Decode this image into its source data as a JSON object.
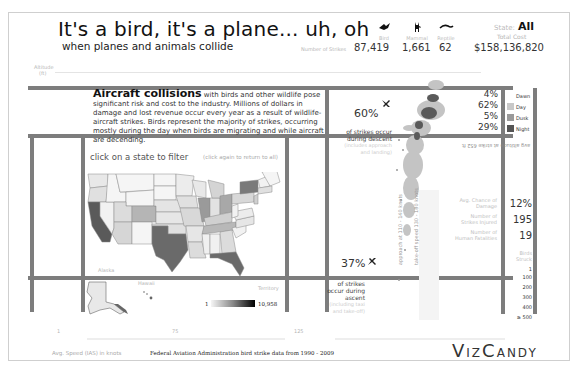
{
  "header": {
    "title": "It's a bird, it's a plane... uh, oh",
    "subtitle": "when planes and animals collide",
    "strikes_label": "Number of Strikes",
    "categories": [
      {
        "icon": "bird-icon",
        "glyph": "🕊",
        "label": "Bird",
        "count": "87,419"
      },
      {
        "icon": "deer-icon",
        "glyph": "🦌",
        "label": "Mammal",
        "count": "1,661"
      },
      {
        "icon": "reptile-icon",
        "glyph": "〰",
        "label": "Reptile",
        "count": "62"
      }
    ],
    "state_label": "State:",
    "state_value": "All",
    "total_cost_label": "Total Cost",
    "total_cost_value": "$158,136,820"
  },
  "axes": {
    "altitude_label": "Altitude",
    "altitude_unit": "(ft)",
    "speed_label": "Avg. Speed (IAS) in knots",
    "speed_ticks": [
      "1",
      "75",
      "125"
    ]
  },
  "intro": {
    "lead": "Aircraft collisions",
    "body": "with birds and other wildlife pose significant risk and cost to the industry.  Millions of dollars in damage and lost revenue occur every year as a result of wildlife-aircraft strikes.  Birds represent the majority of strikes, occurring mostly during the day when birds are migrating and while aircraft are decending."
  },
  "descent": {
    "percent": "60%",
    "line1": "of strikes occur",
    "line2": "during descent",
    "detail": "(includes approach and landing)"
  },
  "ascent": {
    "percent": "37%",
    "line1": "of strikes",
    "line2": "occur during",
    "line3": "ascent",
    "detail": "(including taxi and take-off)"
  },
  "time_of_day": {
    "items": [
      {
        "label": "Dawn",
        "percent": "4%",
        "color": "#ffffff"
      },
      {
        "label": "Day",
        "percent": "62%",
        "color": "#c8c8c8"
      },
      {
        "label": "Dusk",
        "percent": "5%",
        "color": "#9a9a9a"
      },
      {
        "label": "Night",
        "percent": "29%",
        "color": "#555555"
      }
    ]
  },
  "avg_altitude_label": "avg altitude at strike 652 ft",
  "stats": [
    {
      "label": "Avg. Chance of Damage",
      "value": "12%"
    },
    {
      "label": "Number of Strikes Injured",
      "value": "195"
    },
    {
      "label": "Number of Human Fatalities",
      "value": "19"
    }
  ],
  "strike_size": {
    "label": "Birds Struck",
    "ticks": [
      "1",
      "100",
      "200",
      "300",
      "400",
      "≥ 500"
    ]
  },
  "scatter_labels": {
    "approach": "approach at 110 - 140 knots",
    "takeoff": "take-off speed 130 - 180 knots"
  },
  "map": {
    "title": "click on a state to filter",
    "hint": "(click again to return to all)",
    "alaska_label": "Alaska",
    "hawaii_label": "Hawaii",
    "territories_label": "Territory",
    "legend_min": "1",
    "legend_max": "10,958"
  },
  "footer": {
    "source": "Federal Aviation Administration bird strike data from 1990 - 2009",
    "logo": "VizCandy"
  },
  "colors": {
    "grid_bar": "#7d7d7d",
    "scatter_light": "#c4c4c4",
    "scatter_dark": "#5a5a5a",
    "state_high": "#5a5a5a"
  }
}
